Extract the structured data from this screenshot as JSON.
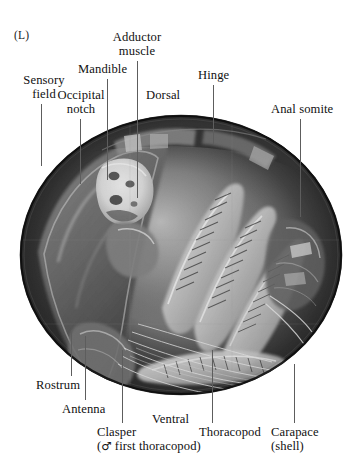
{
  "figure": {
    "panel_letter": "(L)",
    "caption_subject": "ostracod-sem-micrograph",
    "image_kind": "scanning-electron-micrograph",
    "background_color": "#ffffff",
    "ink_color": "#111111",
    "leader_color": "#5d5d5d"
  },
  "labels": {
    "sensory_field": "Sensory\nfield",
    "sensory_field_line1": "Sensory",
    "sensory_field_line2": "field",
    "occipital_notch_line1": "Occipital",
    "occipital_notch_line2": "notch",
    "mandible": "Mandible",
    "adductor_muscle_line1": "Adductor",
    "adductor_muscle_line2": "muscle",
    "dorsal": "Dorsal",
    "hinge": "Hinge",
    "anal_somite": "Anal somite",
    "rostrum": "Rostrum",
    "antenna": "Antenna",
    "clasper_line1": "Clasper",
    "clasper_line2_pre": "(",
    "clasper_line2_sym": "♂",
    "clasper_line2_post": " first  thoracopod)",
    "ventral": "Ventral",
    "thoracopod": "Thoracopod",
    "carapace_line1": "Carapace",
    "carapace_line2": "(shell)"
  }
}
